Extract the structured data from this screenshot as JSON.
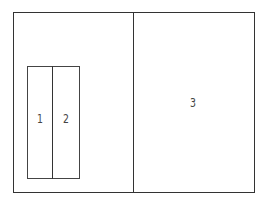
{
  "diagram": {
    "regions": [
      {
        "id": "1",
        "label": "1"
      },
      {
        "id": "2",
        "label": "2"
      },
      {
        "id": "3",
        "label": "3"
      }
    ],
    "line_color": "#333333"
  }
}
